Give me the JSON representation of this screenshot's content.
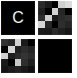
{
  "canvas": {
    "width": 77,
    "height": 78,
    "background_color": "#ffffff"
  },
  "grid": {
    "columns": 2,
    "rows": 2,
    "tile_size_px": 34,
    "column_gap_px": 3,
    "row_gap_px": 4
  },
  "palette": {
    "black": "#000000",
    "near_black": "#0b0b0b",
    "dark_gray": "#1c1c1c",
    "mid_dark_gray": "#2b2b2b",
    "gray": "#3a3a3a",
    "light_gray": "#c8c8c8",
    "lighter_gray": "#dcdcdc",
    "white": "#f2f2f2"
  },
  "tiles": [
    {
      "id": "tile-1",
      "kind": "letter",
      "label": "C",
      "background_color": "#000000",
      "glyph_color": "#f2f2f2"
    },
    {
      "id": "tile-2",
      "kind": "pattern",
      "label": "",
      "background_color": "#121212",
      "cells": [
        "#2a2a2a",
        "#1a1a1a",
        "#000000",
        "#cfcfcf",
        "#dcdcdc",
        "#1f1f1f",
        "#000000",
        "#d2d2d2",
        "#262626",
        "#000000",
        "#2d2d2d",
        "#cfcfcf",
        "#1a1a1a",
        "#2a2a2a",
        "#303030",
        "#d6d6d6",
        "#262626",
        "#000000",
        "#2e2e2e",
        "#242424",
        "#1c1c1c",
        "#1a1a1a",
        "#2b2b2b",
        "#202020",
        "#171717"
      ]
    },
    {
      "id": "tile-3",
      "kind": "pattern",
      "label": "",
      "background_color": "#121212",
      "cells": [
        "#303030",
        "#262626",
        "#d2d2d2",
        "#1a1a1a",
        "#000000",
        "#000000",
        "#d6d6d6",
        "#202020",
        "#2c2c2c",
        "#242424",
        "#cfcfcf",
        "#1e1e1e",
        "#2a2a2a",
        "#343434",
        "#2b2b2b",
        "#1a1a1a",
        "#000000",
        "#c8c8c8",
        "#2e2e2e",
        "#1f1f1f",
        "#141414",
        "#1c1c1c",
        "#222222",
        "#191919",
        "#101010"
      ]
    },
    {
      "id": "tile-4",
      "kind": "solid",
      "label": "",
      "background_color": "#000000",
      "cells": []
    }
  ]
}
